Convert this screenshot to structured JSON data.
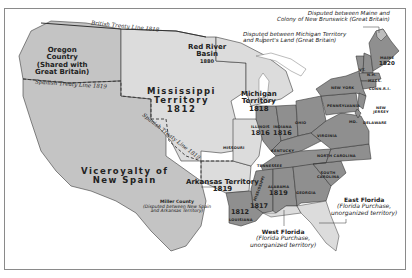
{
  "map": {
    "title": "United States, 1820",
    "colors": {
      "territory_light": "#dcdcdc",
      "foreign_region": "#c4c4c4",
      "state_dark": "#8f8f8f",
      "state_mid": "#a5a5a5",
      "disputed": "#bdbdbd",
      "border": "#3a3a3a",
      "water": "#ffffff"
    },
    "treaty_lines": [
      {
        "label": "British Treaty Line 1818"
      },
      {
        "label": "Spanish Treaty Line 1819"
      },
      {
        "label": "Spanish Treaty Line 1819"
      }
    ],
    "regions": {
      "oregon": {
        "line1": "Oregon",
        "line2": "Country",
        "line3": "(Shared with",
        "line4": "Great Britain)"
      },
      "red_river": {
        "line1": "Red River",
        "line2": "Basin",
        "year": "1880"
      },
      "mississippi": {
        "line1": "Mississippi",
        "line2": "Territory",
        "year": "1812"
      },
      "michigan": {
        "line1": "Michigan",
        "line2": "Territory",
        "year": "1818"
      },
      "viceroyalty": {
        "line1": "Viceroyalty of",
        "line2": "New Spain"
      },
      "arkansas": {
        "line1": "Arkansas Territory",
        "year": "1819"
      },
      "miller": {
        "line1": "Miller County",
        "line2": "(Disputed between New Spain",
        "line3": "and Arkansas Territory)"
      },
      "west_florida": {
        "line1": "West Florida",
        "line2": "(Florida Purchase,",
        "line3": "unorganized territory)"
      },
      "east_florida": {
        "line1": "East Florida",
        "line2": "(Florida Purchase,",
        "line3": "unorganized territory)"
      }
    },
    "callouts": {
      "maine_nb": {
        "line1": "Disputed between Maine and",
        "line2": "Colony of New Brunswick (Great Britain)"
      },
      "michigan_rupert": {
        "line1": "Disputed between Michigan Territory",
        "line2": "and Rupert's Land (Great Britain)"
      }
    },
    "states": {
      "maine": {
        "name": "MAINE",
        "year": "1820"
      },
      "vermont": {
        "name": "VT."
      },
      "nh": {
        "name": "N.H."
      },
      "mass": {
        "name": "MASS."
      },
      "ri": {
        "name": "R.I."
      },
      "conn": {
        "name": "CONN."
      },
      "new_york": {
        "name": "NEW YORK"
      },
      "new_jersey": {
        "name": "NEW JERSEY"
      },
      "pennsylvania": {
        "name": "PENNSYLVANIA"
      },
      "delaware": {
        "name": "DELAWARE"
      },
      "maryland": {
        "name": "MD."
      },
      "virginia": {
        "name": "VIRGINIA"
      },
      "north_carolina": {
        "name": "NORTH CAROLINA"
      },
      "south_carolina": {
        "name": "SOUTH CAROLINA"
      },
      "georgia": {
        "name": "GEORGIA"
      },
      "ohio": {
        "name": "OHIO"
      },
      "kentucky": {
        "name": "KENTUCKY"
      },
      "tennessee": {
        "name": "TENNESSEE"
      },
      "indiana": {
        "name": "INDIANA",
        "year": "1816"
      },
      "illinois": {
        "name": "ILLINOIS",
        "year": "1816"
      },
      "missouri": {
        "name": "MISSOURI"
      },
      "alabama": {
        "name": "ALABAMA",
        "year": "1819"
      },
      "mississippi_state": {
        "name": "MISSISSIPPI",
        "year": "1817"
      },
      "louisiana": {
        "name": "LOUISIANA",
        "year": "1812"
      }
    }
  }
}
